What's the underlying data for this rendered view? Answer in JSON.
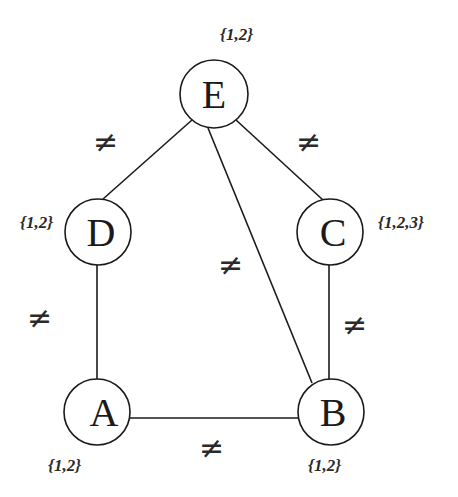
{
  "diagram": {
    "type": "constraint-graph",
    "nodes": [
      {
        "id": "E",
        "label": "E",
        "domain": "{1,2}",
        "cx": 214,
        "cy": 94,
        "r": 34
      },
      {
        "id": "D",
        "label": "D",
        "domain": "{1,2}",
        "cx": 98,
        "cy": 232,
        "r": 33
      },
      {
        "id": "C",
        "label": "C",
        "domain": "{1,2,3}",
        "cx": 331,
        "cy": 232,
        "r": 33
      },
      {
        "id": "A",
        "label": "A",
        "domain": "{1,2}",
        "cx": 98,
        "cy": 412,
        "r": 33
      },
      {
        "id": "B",
        "label": "B",
        "domain": "{1,2}",
        "cx": 331,
        "cy": 412,
        "r": 33
      }
    ],
    "edges": [
      {
        "from": "E",
        "to": "D",
        "constraint": "≠"
      },
      {
        "from": "E",
        "to": "C",
        "constraint": "≠"
      },
      {
        "from": "E",
        "to": "B",
        "constraint": "≠"
      },
      {
        "from": "D",
        "to": "A",
        "constraint": "≠"
      },
      {
        "from": "C",
        "to": "B",
        "constraint": "≠"
      },
      {
        "from": "A",
        "to": "B",
        "constraint": "≠"
      }
    ],
    "colors": {
      "stroke": "#1a1a1a",
      "background": "#ffffff"
    }
  }
}
